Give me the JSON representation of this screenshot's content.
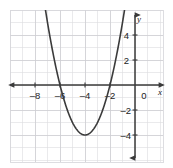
{
  "chart_data": {
    "type": "line",
    "title": "",
    "subtitle": "",
    "xlabel": "x",
    "ylabel": "y",
    "grid": true,
    "legend": "none",
    "xlim": [
      -9.8,
      2.9
    ],
    "ylim": [
      -6.0,
      6.1
    ],
    "x_ticks": [
      -8,
      -6,
      -4,
      -2,
      0
    ],
    "x_tick_labels": [
      "–8",
      "–6",
      "–4",
      "–2",
      "0"
    ],
    "y_ticks": [
      4,
      2,
      -2,
      -4
    ],
    "y_tick_labels": [
      "4",
      "2",
      "–2",
      "–4"
    ],
    "grid_step": 1,
    "tick_step": 2,
    "series": [
      {
        "name": "parabola",
        "type": "quadratic",
        "equation": "y = (x + 4)^2 - 4",
        "coefficients": {
          "a": 1,
          "b": 8,
          "c": 12
        },
        "vertex": [
          -4,
          -4
        ],
        "roots": [
          -6,
          -2
        ],
        "y_intercept": 12,
        "x_start": -7.05,
        "x_end": -0.95,
        "points": [
          [
            -7.0,
            5.0
          ],
          [
            -6.5,
            2.25
          ],
          [
            -6.0,
            0.0
          ],
          [
            -5.5,
            -1.75
          ],
          [
            -5.0,
            -3.0
          ],
          [
            -4.5,
            -3.75
          ],
          [
            -4.0,
            -4.0
          ],
          [
            -3.5,
            -3.75
          ],
          [
            -3.0,
            -3.0
          ],
          [
            -2.5,
            -1.75
          ],
          [
            -2.0,
            0.0
          ],
          [
            -1.5,
            2.25
          ],
          [
            -1.0,
            5.0
          ]
        ],
        "color": "#3b3b3b",
        "line_width": 1.6,
        "arrow_ends": "both"
      }
    ],
    "colors": {
      "grid_minor": "#d9d9dd",
      "grid_major": "#c9c9cf",
      "axis": "#3a3a3a",
      "curve": "#3b3b3b",
      "text": "#222222",
      "background": "#ffffff",
      "panel_border": "#d5d5da"
    },
    "annotations": []
  }
}
